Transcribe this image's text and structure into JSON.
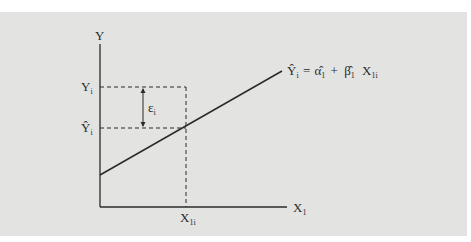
{
  "figure": {
    "type": "regression-line-diagram",
    "y_axis_label": "Y",
    "x_axis_label": "X",
    "x_axis_label_sub": "1",
    "observed_y_label": "Y",
    "observed_y_label_sub": "i",
    "fitted_y_label": "Ŷ",
    "fitted_y_label_sub": "i",
    "error_label": "ε",
    "error_label_sub": "i",
    "x_point_label": "X",
    "x_point_label_sub": "1i",
    "equation": {
      "lhs": "Ŷ",
      "lhs_sub": "i",
      "equals": "=",
      "alpha": "α̂",
      "alpha_sub": "1",
      "plus": "+",
      "beta": "β̂",
      "beta_sub": "1",
      "x": "X",
      "x_sub": "1i"
    }
  },
  "colors": {
    "background": "#e3e3e1",
    "ink": "#2b2b2b"
  }
}
